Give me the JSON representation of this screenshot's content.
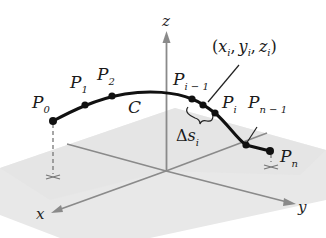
{
  "figure": {
    "type": "3D space curve partition diagram",
    "axes": {
      "x": {
        "label": "x",
        "color": "#8a8a8a"
      },
      "y": {
        "label": "y",
        "color": "#8a8a8a"
      },
      "z": {
        "label": "z",
        "color": "#8a8a8a"
      }
    },
    "plane_color": "#e6e6e6",
    "curve": {
      "label": "C",
      "color": "#111111"
    },
    "points": [
      {
        "name": "P",
        "sub": "0"
      },
      {
        "name": "P",
        "sub": "1"
      },
      {
        "name": "P",
        "sub": "2"
      },
      {
        "name": "P",
        "sub": "i − 1"
      },
      {
        "name": "P",
        "sub": "i"
      },
      {
        "name": "P",
        "sub": "n − 1"
      },
      {
        "name": "P",
        "sub": "n"
      }
    ],
    "annotations": {
      "coordinate": {
        "open": "(",
        "x": "x",
        "x_sub": "i",
        "y": "y",
        "y_sub": "i",
        "z": "z",
        "z_sub": "i",
        "comma": ",",
        "close": ")"
      },
      "arc_length": {
        "delta": "Δ",
        "s": "s",
        "sub": "i"
      }
    }
  }
}
